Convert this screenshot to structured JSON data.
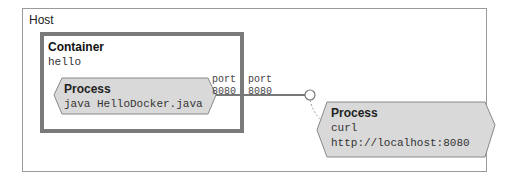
{
  "host": {
    "label": "Host"
  },
  "container": {
    "title": "Container",
    "name": "hello"
  },
  "process_java": {
    "title": "Process",
    "command": "java HelloDocker.java"
  },
  "process_curl": {
    "title": "Process",
    "command": "curl",
    "url": "http://localhost:8080"
  },
  "ports": {
    "container_port": {
      "label": "port",
      "number": "8080"
    },
    "host_port": {
      "label": "port",
      "number": "8080"
    }
  },
  "colors": {
    "border": "#7a7a7a",
    "process_fill": "#d9d9d9",
    "line": "#777777"
  }
}
